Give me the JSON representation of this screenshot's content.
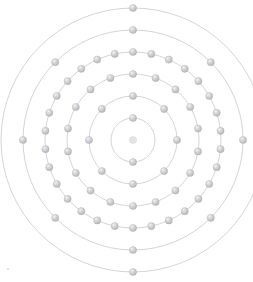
{
  "figure": {
    "element_symbol": "Er",
    "element_name": "Erbium",
    "atomic_number": 68,
    "electron_configuration_text": "2.8.18.30.8.2",
    "visible_symbol_text": "E",
    "visible_config_text": "2.8.",
    "nucleus_label": "nucleus",
    "background_color": "#ffffff",
    "ring_color": "#b9b9bd",
    "electron_color": "#c6c6ca",
    "electron_highlight_color": "#ececed",
    "text_color": "#7a7a7f",
    "center_x": 133,
    "center_y": 140
  },
  "chart_data": {
    "type": "scatter",
    "xlabel": "",
    "ylabel": "",
    "grid": false,
    "legend": "none",
    "shells": [
      {
        "index": 1,
        "name": "K",
        "electrons": 2,
        "radius": 22,
        "start_angle": -90
      },
      {
        "index": 2,
        "name": "L",
        "electrons": 8,
        "radius": 44,
        "start_angle": -90
      },
      {
        "index": 3,
        "name": "M",
        "electrons": 18,
        "radius": 66,
        "start_angle": -90
      },
      {
        "index": 4,
        "name": "N",
        "electrons": 30,
        "radius": 88,
        "start_angle": -90
      },
      {
        "index": 5,
        "name": "O",
        "electrons": 8,
        "radius": 110,
        "start_angle": -90
      },
      {
        "index": 6,
        "name": "P",
        "electrons": 2,
        "radius": 132,
        "start_angle": -90
      }
    ],
    "electron_radius": 3.6,
    "total_electrons": 68,
    "categories": [
      "K",
      "L",
      "M",
      "N",
      "O",
      "P"
    ],
    "values": [
      2,
      8,
      18,
      30,
      8,
      2
    ]
  }
}
